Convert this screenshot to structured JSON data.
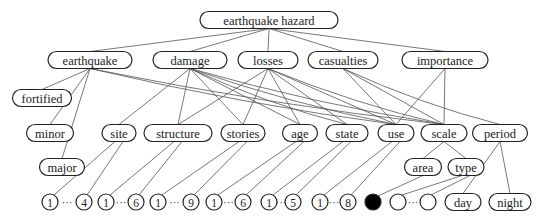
{
  "diagram": {
    "title": "earthquake hazard",
    "colors": {
      "stroke": "#222222",
      "edge": "#555555",
      "fill": "#ffffff",
      "filled_leaf": "#000000"
    },
    "nodes": {
      "root": {
        "label": "earthquake hazard",
        "x": 269,
        "y": 20,
        "w": 138
      },
      "earthquake": {
        "label": "earthquake",
        "x": 90,
        "y": 60,
        "w": 84
      },
      "damage": {
        "label": "damage",
        "x": 190,
        "y": 60,
        "w": 74
      },
      "losses": {
        "label": "losses",
        "x": 268,
        "y": 60,
        "w": 60
      },
      "casualties": {
        "label": "casualties",
        "x": 343,
        "y": 60,
        "w": 70
      },
      "importance": {
        "label": "importance",
        "x": 445,
        "y": 60,
        "w": 86
      },
      "fortified": {
        "label": "fortified",
        "x": 42,
        "y": 98,
        "w": 59
      },
      "minor": {
        "label": "minor",
        "x": 50,
        "y": 133,
        "w": 47
      },
      "site": {
        "label": "site",
        "x": 119,
        "y": 133,
        "w": 34
      },
      "structure": {
        "label": "structure",
        "x": 178,
        "y": 133,
        "w": 68
      },
      "stories": {
        "label": "stories",
        "x": 243,
        "y": 133,
        "w": 44
      },
      "age": {
        "label": "age",
        "x": 300,
        "y": 133,
        "w": 35
      },
      "state": {
        "label": "state",
        "x": 347,
        "y": 133,
        "w": 42
      },
      "use": {
        "label": "use",
        "x": 396,
        "y": 133,
        "w": 36
      },
      "scale": {
        "label": "scale",
        "x": 444,
        "y": 133,
        "w": 46
      },
      "period": {
        "label": "period",
        "x": 500,
        "y": 133,
        "w": 55
      },
      "major": {
        "label": "major",
        "x": 62,
        "y": 167,
        "w": 45
      },
      "area": {
        "label": "area",
        "x": 423,
        "y": 167,
        "w": 37
      },
      "type": {
        "label": "type",
        "x": 466,
        "y": 167,
        "w": 36
      },
      "day": {
        "label": "day",
        "x": 463,
        "y": 202,
        "w": 36
      },
      "night": {
        "label": "night",
        "x": 510,
        "y": 202,
        "w": 42
      }
    },
    "leaf_ranges": [
      {
        "parent": "site",
        "start": "1",
        "end": "4",
        "x1": 50,
        "x2": 84
      },
      {
        "parent": "structure",
        "start": "1",
        "end": "6",
        "x1": 106,
        "x2": 136
      },
      {
        "parent": "stories",
        "start": "1",
        "end": "9",
        "x1": 158,
        "x2": 191
      },
      {
        "parent": "age",
        "start": "1",
        "end": "6",
        "x1": 214,
        "x2": 243
      },
      {
        "parent": "state",
        "start": "1",
        "end": "5",
        "x1": 269,
        "x2": 293
      },
      {
        "parent": "use",
        "start": "1",
        "end": "8",
        "x1": 320,
        "x2": 348
      },
      {
        "parent": "type",
        "start": "",
        "end": "",
        "x1": 398,
        "x2": 428
      }
    ],
    "ellipsis": "···",
    "filled_leaf": {
      "parent": "area",
      "x": 373,
      "y": 202
    },
    "edges": [
      [
        "root",
        "earthquake"
      ],
      [
        "root",
        "damage"
      ],
      [
        "root",
        "losses"
      ],
      [
        "root",
        "casualties"
      ],
      [
        "root",
        "importance"
      ],
      [
        "earthquake",
        "fortified"
      ],
      [
        "earthquake",
        "minor"
      ],
      [
        "earthquake",
        "major"
      ],
      [
        "earthquake",
        "use"
      ],
      [
        "earthquake",
        "scale"
      ],
      [
        "damage",
        "site"
      ],
      [
        "damage",
        "structure"
      ],
      [
        "damage",
        "stories"
      ],
      [
        "damage",
        "age"
      ],
      [
        "damage",
        "state"
      ],
      [
        "damage",
        "use"
      ],
      [
        "damage",
        "scale"
      ],
      [
        "losses",
        "structure"
      ],
      [
        "losses",
        "stories"
      ],
      [
        "losses",
        "age"
      ],
      [
        "losses",
        "state"
      ],
      [
        "losses",
        "use"
      ],
      [
        "losses",
        "scale"
      ],
      [
        "casualties",
        "use"
      ],
      [
        "casualties",
        "scale"
      ],
      [
        "casualties",
        "period"
      ],
      [
        "importance",
        "use"
      ],
      [
        "importance",
        "scale"
      ],
      [
        "scale",
        "area"
      ],
      [
        "scale",
        "type"
      ],
      [
        "period",
        "day"
      ],
      [
        "period",
        "night"
      ]
    ]
  }
}
